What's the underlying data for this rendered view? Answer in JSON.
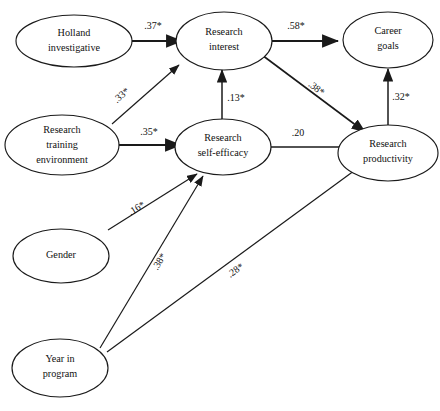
{
  "figure": {
    "type": "path-diagram",
    "background_color": "#ffffff",
    "stroke_color": "#1a1a1a",
    "text_color": "#111111"
  },
  "nodes": [
    {
      "id": "holland",
      "line1": "Holland",
      "line2": "investigative",
      "line3": ""
    },
    {
      "id": "training",
      "line1": "Research",
      "line2": "training",
      "line3": "environment"
    },
    {
      "id": "gender",
      "line1": "Gender",
      "line2": "",
      "line3": ""
    },
    {
      "id": "year",
      "line1": "Year in",
      "line2": "program",
      "line3": ""
    },
    {
      "id": "interest",
      "line1": "Research",
      "line2": "interest",
      "line3": ""
    },
    {
      "id": "efficacy",
      "line1": "Research",
      "line2": "self-efficacy",
      "line3": ""
    },
    {
      "id": "goals",
      "line1": "Career",
      "line2": "goals",
      "line3": ""
    },
    {
      "id": "productivity",
      "line1": "Research",
      "line2": "productivity",
      "line3": ""
    }
  ],
  "paths": [
    {
      "id": "holland-interest",
      "from": "holland",
      "to": "interest",
      "label": ".37*"
    },
    {
      "id": "training-interest",
      "from": "training",
      "to": "interest",
      "label": ".33*"
    },
    {
      "id": "training-efficacy",
      "from": "training",
      "to": "efficacy",
      "label": ".35*"
    },
    {
      "id": "efficacy-interest",
      "from": "efficacy",
      "to": "interest",
      "label": ".13*"
    },
    {
      "id": "interest-goals",
      "from": "interest",
      "to": "goals",
      "label": ".58*"
    },
    {
      "id": "interest-productivity",
      "from": "interest",
      "to": "productivity",
      "label": ".38*"
    },
    {
      "id": "efficacy-productivity",
      "from": "efficacy",
      "to": "productivity",
      "label": ".20"
    },
    {
      "id": "productivity-goals",
      "from": "productivity",
      "to": "goals",
      "label": ".32*"
    },
    {
      "id": "gender-efficacy",
      "from": "gender",
      "to": "efficacy",
      "label": ".16*"
    },
    {
      "id": "year-efficacy",
      "from": "year",
      "to": "efficacy",
      "label": ".38*"
    },
    {
      "id": "year-productivity",
      "from": "year",
      "to": "productivity",
      "label": ".28*"
    }
  ]
}
